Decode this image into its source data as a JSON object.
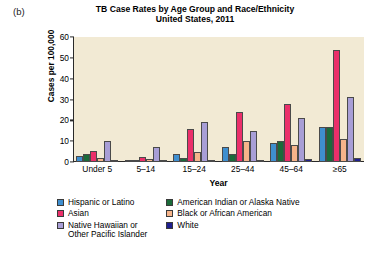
{
  "panel_letter": "(b)",
  "title": {
    "line1": "TB Case Rates by Age Group and Race/Ethnicity",
    "line2": "United States, 2011"
  },
  "chart_data": {
    "type": "bar",
    "title": "TB Case Rates by Age Group and Race/Ethnicity United States, 2011",
    "xlabel": "Year",
    "ylabel": "Cases per 100,000",
    "ylim": [
      0,
      60
    ],
    "yticks": [
      0,
      10,
      20,
      30,
      40,
      50,
      60
    ],
    "grid": false,
    "legend_position": "bottom",
    "plot_background": "#f2ead4",
    "categories": [
      "Under 5",
      "5–14",
      "15–24",
      "25–44",
      "45–64",
      "≥65"
    ],
    "series": [
      {
        "name": "Hispanic or Latino",
        "color": "#3f8fd0",
        "values": [
          3,
          0.7,
          4,
          7,
          9,
          17
        ]
      },
      {
        "name": "American Indian or Alaska Native",
        "color": "#1b6b3a",
        "values": [
          4,
          0.6,
          2,
          4,
          10,
          17
        ]
      },
      {
        "name": "Asian",
        "color": "#eb2f6a",
        "values": [
          5.5,
          2.5,
          16,
          24,
          28,
          54
        ]
      },
      {
        "name": "Black or African American",
        "color": "#f6b48a",
        "values": [
          2,
          1.5,
          5,
          10,
          8,
          11
        ]
      },
      {
        "name": "Native Hawaiian or Other Pacific Islander",
        "color": "#a89ed6",
        "values": [
          10,
          7,
          19,
          15,
          21,
          31
        ]
      },
      {
        "name": "White",
        "color": "#1f1f8f",
        "values": [
          1,
          0.8,
          1,
          1.2,
          1.5,
          2
        ]
      }
    ]
  },
  "legend": {
    "column1": [
      {
        "label": "Hispanic or Latino",
        "color": "#3f8fd0"
      },
      {
        "label": "Asian",
        "color": "#eb2f6a"
      },
      {
        "label": "Native Hawaiian or\nOther Pacific Islander",
        "color": "#a89ed6"
      }
    ],
    "column2": [
      {
        "label": "American Indian or Alaska Native",
        "color": "#1b6b3a"
      },
      {
        "label": "Black or African American",
        "color": "#f6b48a"
      },
      {
        "label": "White",
        "color": "#1f1f8f"
      }
    ]
  }
}
